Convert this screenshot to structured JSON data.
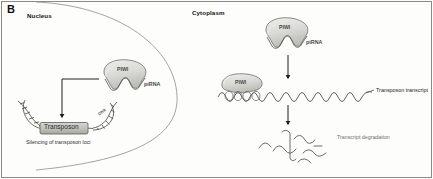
{
  "figure": {
    "panel_letter": "B",
    "border_color": "#8a8a8a",
    "background": "#fdfdfc"
  },
  "compartments": {
    "nucleus_label": "Nucleus",
    "cytoplasm_label": "Cytoplasm",
    "membrane_color": "#9a9a94"
  },
  "nucleus": {
    "piwi_label": "PIWI",
    "pirna_label": "piRNA",
    "dna_label": "DNA",
    "transposon_label": "Transposon",
    "caption": "Silencing of transposon loci",
    "protein_fill": "#d6d6d2",
    "protein_stroke": "#6f6f6b",
    "dna_color": "#4f4f4b",
    "box_fill": "#bfbfbb",
    "arrow_color": "#1e1e1e"
  },
  "cytoplasm": {
    "piwi_label": "PIWI",
    "pirna_label": "piRNA",
    "loaded_piwi_label": "PIWI",
    "transcript_label": "Transposon transcript",
    "degradation_label": "Transcript degradation",
    "transcript_color": "#5a5a56",
    "fragment_color": "#6b6b67",
    "arrow_color": "#1e1e1e",
    "protein_fill": "#d6d6d2",
    "protein_stroke": "#6f6f6b"
  }
}
